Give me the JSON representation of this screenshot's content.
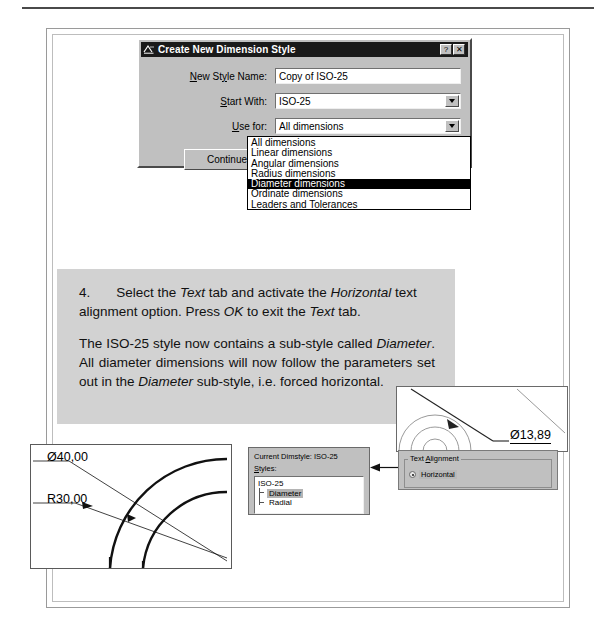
{
  "dialog": {
    "title": "Create New Dimension Style",
    "icon": "dimension-style-icon",
    "help_button": "?",
    "close_button": "✕",
    "fields": [
      {
        "label_pre": "N",
        "label_key": "N",
        "label_rest": "ew Style Name:",
        "value": "Copy of ISO-25"
      },
      {
        "label_rest": "tart With:",
        "label_key": "S",
        "value": "ISO-25"
      },
      {
        "label_rest": "se for:",
        "label_key": "U",
        "value": "All dimensions"
      }
    ],
    "new_style_name_label": "New Style Name:",
    "new_style_name_value": "Copy of ISO-25",
    "start_with_label": "Start With:",
    "start_with_value": "ISO-25",
    "use_for_label": "Use for:",
    "use_for_value": "All dimensions",
    "continue_label": "Continue",
    "dropdown_options": [
      "All dimensions",
      "Linear dimensions",
      "Angular dimensions",
      "Radius dimensions",
      "Diameter dimensions",
      "Ordinate dimensions",
      "Leaders and Tolerances"
    ],
    "dropdown_selected": "Diameter dimensions"
  },
  "instructions": {
    "step_number": "4.",
    "p1_a": "Select the ",
    "p1_i1": "Text",
    "p1_b": " tab and activate the ",
    "p1_i2": "Horizontal",
    "p1_c": " text alignment option. Press ",
    "p1_i3": "OK",
    "p1_d": " to exit the ",
    "p1_i4": "Text",
    "p1_e": " tab.",
    "p2_a": "The ISO-25 style now contains a sub-style called ",
    "p2_i1": "Diameter",
    "p2_b": ". All diameter dimensions will now follow the parameters set out in the ",
    "p2_i2": "Diameter",
    "p2_c": " sub-style, i.e. forced horizontal."
  },
  "cad_left": {
    "diameter_label": "Ø40,00",
    "radius_label": "R30,00"
  },
  "cad_right": {
    "diameter_label": "Ø13,89"
  },
  "dimstyle_panel": {
    "current_label": "Current Dimstyle: ISO-25",
    "styles_label": "Styles:",
    "styles_label_key": "S",
    "tree_root": "ISO-25",
    "tree_children": [
      "Diameter",
      "Radial"
    ],
    "tree_selected": "Diameter"
  },
  "text_alignment": {
    "group_title": "Text Alignment",
    "group_title_key": "A",
    "option_label": "Horizontal",
    "option_selected": true
  },
  "colors": {
    "dialog_face": "#c0c0c0",
    "titlebar": "#1a1a1a",
    "text_block_bg": "#d2d2d2",
    "selection": "#000000",
    "tree_selection": "#b4b4b4"
  }
}
